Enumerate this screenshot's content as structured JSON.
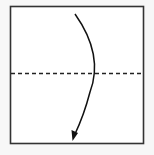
{
  "diagram": {
    "type": "origami-fold",
    "fold_line_style": "dashed",
    "fold_direction": "down",
    "colors": {
      "background": "#f7f7f7",
      "paper": "#ffffff",
      "stroke": "#222222"
    }
  }
}
